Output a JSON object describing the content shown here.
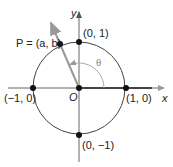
{
  "diagram": {
    "axes": {
      "x_label": "x",
      "y_label": "y",
      "origin_label": "O"
    },
    "angle_label": "θ",
    "points": [
      {
        "id": "p",
        "label": "P = (a, b)"
      },
      {
        "id": "top",
        "label": "(0, 1)"
      },
      {
        "id": "right",
        "label": "(1, 0)"
      },
      {
        "id": "left",
        "label": "(−1, 0)"
      },
      {
        "id": "bottom",
        "label": "(0, −1)"
      }
    ],
    "colors": {
      "axis": "#555555",
      "circle": "#444444",
      "ray": "#999999",
      "point": "#111111",
      "arc": "#aaaaaa"
    }
  }
}
